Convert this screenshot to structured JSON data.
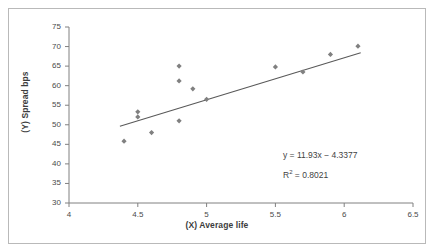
{
  "chart_data": {
    "type": "scatter",
    "title": "",
    "xlabel": "(X) Average life",
    "ylabel": "(Y) Spread bps",
    "xlim": [
      4,
      6.5
    ],
    "ylim": [
      30,
      75
    ],
    "xticks": [
      "4",
      "4.5",
      "5",
      "5.5",
      "6",
      "6.5"
    ],
    "xtick_values": [
      4,
      4.5,
      5,
      5.5,
      6,
      6.5
    ],
    "yticks": [
      "75",
      "70",
      "65",
      "60",
      "55",
      "50",
      "45",
      "40",
      "35",
      "30"
    ],
    "ytick_values": [
      75,
      70,
      65,
      60,
      55,
      50,
      45,
      40,
      35,
      30
    ],
    "grid": false,
    "legend": null,
    "marker_color": "#808080",
    "marker_shape": "diamond",
    "trendline_color": "#595959",
    "points": [
      {
        "x": 4.4,
        "y": 45.8
      },
      {
        "x": 4.5,
        "y": 53.3
      },
      {
        "x": 4.5,
        "y": 52.0
      },
      {
        "x": 4.6,
        "y": 48.0
      },
      {
        "x": 4.8,
        "y": 65.0
      },
      {
        "x": 4.8,
        "y": 61.2
      },
      {
        "x": 4.8,
        "y": 51.0
      },
      {
        "x": 4.9,
        "y": 59.2
      },
      {
        "x": 5.0,
        "y": 56.5
      },
      {
        "x": 5.5,
        "y": 64.8
      },
      {
        "x": 5.7,
        "y": 63.5
      },
      {
        "x": 5.9,
        "y": 68.0
      },
      {
        "x": 6.1,
        "y": 70.1
      }
    ],
    "trendline": {
      "x0": 4.37,
      "y0": 49.6,
      "x1": 6.12,
      "y1": 68.4
    },
    "annotations": {
      "equation": "y = 11.93x − 4.3377",
      "r_squared_prefix": "R",
      "r_squared_exponent": "2",
      "r_squared_value": "= 0.8021"
    }
  }
}
